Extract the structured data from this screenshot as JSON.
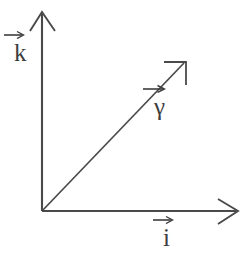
{
  "figure": {
    "background_color": "#ffffff",
    "stroke_color": "#4a4a4a",
    "width": 249,
    "height": 254
  },
  "diagram_data": {
    "type": "vector-diagram",
    "origin": {
      "x": 42,
      "y": 211
    },
    "axes": [
      {
        "name": "vertical-axis",
        "label": "k",
        "label_has_overbar": true,
        "from": {
          "x": 42,
          "y": 211
        },
        "to": {
          "x": 42,
          "y": 13
        },
        "arrowhead": "open-v"
      },
      {
        "name": "horizontal-axis",
        "label": "i",
        "label_has_overbar": true,
        "from": {
          "x": 42,
          "y": 211
        },
        "to": {
          "x": 237,
          "y": 211
        },
        "arrowhead": "open-v"
      },
      {
        "name": "diagonal-axis",
        "label": "γ",
        "label_has_overbar": true,
        "from": {
          "x": 42,
          "y": 211
        },
        "to": {
          "x": 185,
          "y": 62
        },
        "arrowhead": "open-corner"
      }
    ]
  },
  "labels": {
    "k": "k",
    "gamma": "γ",
    "i": "i"
  }
}
